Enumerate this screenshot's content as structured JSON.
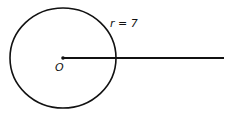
{
  "diagram": {
    "center_label": "O",
    "radius_label": "r = 7",
    "radius_value": 7,
    "colors": {
      "stroke": "#111111",
      "background": "#ffffff"
    }
  }
}
